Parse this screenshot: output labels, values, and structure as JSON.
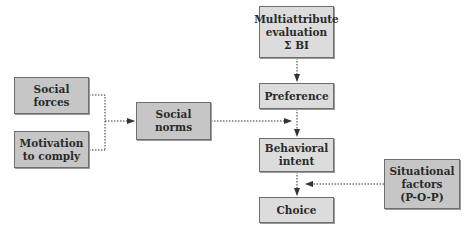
{
  "diagram": {
    "type": "flowchart",
    "nodes": [
      {
        "id": "social_forces",
        "label": "Social\nforces"
      },
      {
        "id": "motivation_to_comply",
        "label": "Motivation\nto comply"
      },
      {
        "id": "social_norms",
        "label": "Social\nnorms"
      },
      {
        "id": "multiattribute_evaluation",
        "label": "Multiattribute\nevaluation\nΣ BI"
      },
      {
        "id": "preference",
        "label": "Preference"
      },
      {
        "id": "behavioral_intent",
        "label": "Behavioral\nintent"
      },
      {
        "id": "choice",
        "label": "Choice"
      },
      {
        "id": "situational_factors",
        "label": "Situational\nfactors\n(P-O-P)"
      }
    ],
    "edges": [
      {
        "from": "social_forces",
        "to": "social_norms",
        "style": "dotted"
      },
      {
        "from": "motivation_to_comply",
        "to": "social_norms",
        "style": "dotted"
      },
      {
        "from": "multiattribute_evaluation",
        "to": "preference",
        "style": "dotted"
      },
      {
        "from": "preference",
        "to": "behavioral_intent",
        "style": "dotted"
      },
      {
        "from": "social_norms",
        "to": "behavioral_intent",
        "style": "dotted"
      },
      {
        "from": "behavioral_intent",
        "to": "choice",
        "style": "dotted"
      },
      {
        "from": "situational_factors",
        "to": "choice",
        "style": "dotted"
      }
    ],
    "colors": {
      "dark_box": "#c6c6c6",
      "light_box": "#dcdcdc",
      "border": "#6e6e6e",
      "edge": "#333333"
    }
  }
}
